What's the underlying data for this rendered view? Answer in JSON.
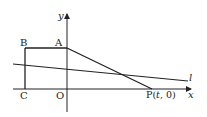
{
  "figure": {
    "labels": {
      "y_axis": "y",
      "x_axis": "x",
      "line_l": "l",
      "A": "A",
      "B": "B",
      "C": "C",
      "O": "O",
      "P_prefix": "P(",
      "P_t": "t",
      "P_suffix": ", 0)"
    },
    "points": {
      "A": [
        67,
        48
      ],
      "B": [
        25,
        48
      ],
      "C": [
        25,
        89
      ],
      "O": [
        67,
        89
      ],
      "P": [
        152,
        89
      ]
    },
    "line_l": {
      "start": [
        13,
        64
      ],
      "end": [
        188,
        81
      ]
    },
    "stroke_color": "#222222"
  }
}
